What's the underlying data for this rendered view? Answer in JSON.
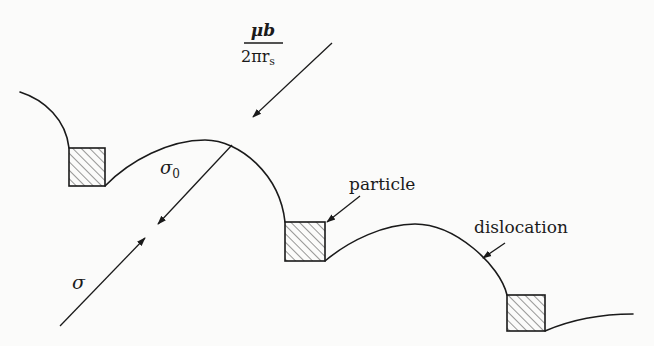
{
  "diagram": {
    "labels": {
      "line_tension_force": {
        "numerator": "μb",
        "denominator_main": "2πr",
        "denominator_sub": "s"
      },
      "internal_stress": {
        "symbol": "σ",
        "subscript": "0"
      },
      "applied_stress": {
        "symbol": "σ"
      },
      "particle": "particle",
      "dislocation": "dislocation"
    },
    "elements": {
      "particles": [
        {
          "id": "particle-1",
          "x": 69,
          "y": 148,
          "w": 36,
          "h": 38
        },
        {
          "id": "particle-2",
          "x": 285,
          "y": 222,
          "w": 40,
          "h": 39
        },
        {
          "id": "particle-3",
          "x": 507,
          "y": 295,
          "w": 38,
          "h": 36
        }
      ],
      "arrows": [
        {
          "id": "line-tension-arrow",
          "from": [
            332,
            43
          ],
          "to": [
            253,
            117
          ]
        },
        {
          "id": "sigma0-arrow",
          "from": [
            232,
            145
          ],
          "to": [
            158,
            224
          ]
        },
        {
          "id": "sigma-arrow",
          "from": [
            60,
            326
          ],
          "to": [
            145,
            238
          ]
        },
        {
          "id": "particle-pointer",
          "from": [
            360,
            196
          ],
          "to": [
            327,
            222
          ]
        },
        {
          "id": "dislocation-pointer",
          "from": [
            505,
            243
          ],
          "to": [
            483,
            258
          ]
        }
      ]
    }
  }
}
